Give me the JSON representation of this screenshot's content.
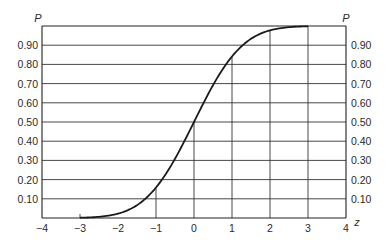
{
  "chart_data": {
    "type": "line",
    "title": "",
    "xlabel": "z",
    "ylabel": "P",
    "ylabel_right": "P",
    "xlim": [
      -4,
      4
    ],
    "ylim": [
      0,
      1.0
    ],
    "grid": true,
    "x_ticks": [
      "-4",
      "-3",
      "-2",
      "-1",
      "0",
      "1",
      "2",
      "3",
      "4"
    ],
    "y_ticks": [
      "0.10",
      "0.20",
      "0.30",
      "0.40",
      "0.50",
      "0.60",
      "0.70",
      "0.80",
      "0.90"
    ],
    "y_ticks_right": [
      "0.10",
      "0.20",
      "0.30",
      "0.40",
      "0.50",
      "0.60",
      "0.70",
      "0.80",
      "0.90"
    ],
    "series": [
      {
        "name": "Cumulative normal P(z)",
        "x": [
          -3,
          -2.5,
          -2,
          -1.5,
          -1,
          -0.5,
          0,
          0.5,
          1,
          1.5,
          2,
          2.5,
          3
        ],
        "values": [
          0.001,
          0.006,
          0.023,
          0.067,
          0.159,
          0.309,
          0.5,
          0.691,
          0.841,
          0.933,
          0.977,
          0.994,
          0.999
        ]
      }
    ],
    "vertical_guides_at": [
      -1,
      0,
      1,
      2,
      3
    ],
    "legend": null
  }
}
